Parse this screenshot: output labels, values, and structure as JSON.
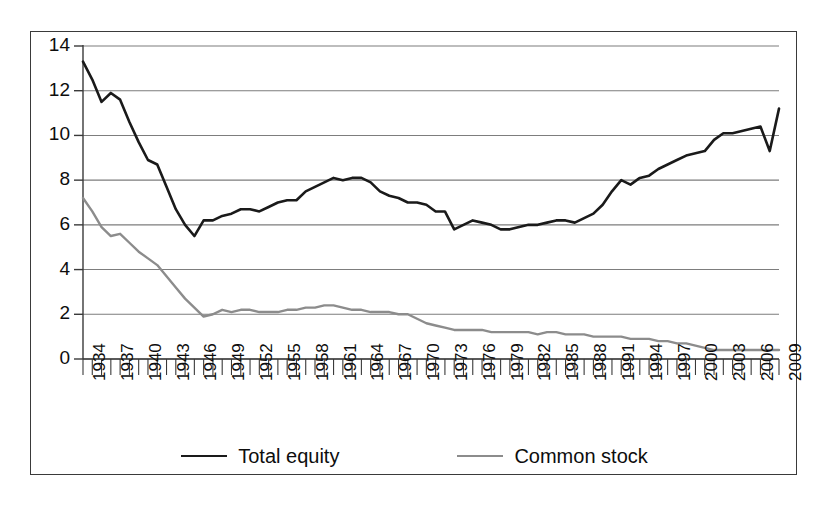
{
  "chart_data": {
    "type": "line",
    "title": "",
    "xlabel": "",
    "ylabel": "",
    "xlim": [
      1934,
      2009
    ],
    "ylim": [
      0,
      14
    ],
    "ytick_step": 2,
    "yticks": [
      0,
      2,
      4,
      6,
      8,
      10,
      12,
      14
    ],
    "xtick_labels": [
      "1934",
      "1937",
      "1940",
      "1943",
      "1946",
      "1949",
      "1952",
      "1955",
      "1958",
      "1961",
      "1964",
      "1967",
      "1970",
      "1973",
      "1976",
      "1979",
      "1982",
      "1985",
      "1988",
      "1991",
      "1994",
      "1997",
      "2000",
      "2003",
      "2006",
      "2009"
    ],
    "xtick_label_interval": 3,
    "minor_tick_interval": 1,
    "grid": "horizontal",
    "legend_position": "bottom",
    "x": [
      1934,
      1935,
      1936,
      1937,
      1938,
      1939,
      1940,
      1941,
      1942,
      1943,
      1944,
      1945,
      1946,
      1947,
      1948,
      1949,
      1950,
      1951,
      1952,
      1953,
      1954,
      1955,
      1956,
      1957,
      1958,
      1959,
      1960,
      1961,
      1962,
      1963,
      1964,
      1965,
      1966,
      1967,
      1968,
      1969,
      1970,
      1971,
      1972,
      1973,
      1974,
      1975,
      1976,
      1977,
      1978,
      1979,
      1980,
      1981,
      1982,
      1983,
      1984,
      1985,
      1986,
      1987,
      1988,
      1989,
      1990,
      1991,
      1992,
      1993,
      1994,
      1995,
      1996,
      1997,
      1998,
      1999,
      2000,
      2001,
      2002,
      2003,
      2004,
      2005,
      2006,
      2007,
      2008,
      2009
    ],
    "series": [
      {
        "name": "Total equity",
        "color": "#1a1a1a",
        "linewidth": 2.6,
        "values": [
          13.3,
          12.5,
          11.5,
          11.9,
          11.6,
          10.6,
          9.7,
          8.9,
          8.7,
          7.7,
          6.7,
          6.0,
          5.5,
          6.2,
          6.2,
          6.4,
          6.5,
          6.7,
          6.7,
          6.6,
          6.8,
          7.0,
          7.1,
          7.1,
          7.5,
          7.7,
          7.9,
          8.1,
          8.0,
          8.1,
          8.1,
          7.9,
          7.5,
          7.3,
          7.2,
          7.0,
          7.0,
          6.9,
          6.6,
          6.6,
          5.8,
          6.0,
          6.2,
          6.1,
          6.0,
          5.8,
          5.8,
          5.9,
          6.0,
          6.0,
          6.1,
          6.2,
          6.2,
          6.1,
          6.3,
          6.5,
          6.9,
          7.5,
          8.0,
          7.8,
          8.1,
          8.2,
          8.5,
          8.7,
          8.9,
          9.1,
          9.2,
          9.3,
          9.8,
          10.1,
          10.1,
          10.2,
          10.3,
          10.4,
          9.3,
          11.2
        ]
      },
      {
        "name": "Common stock",
        "color": "#8c8c8c",
        "linewidth": 2.4,
        "values": [
          7.2,
          6.6,
          5.9,
          5.5,
          5.6,
          5.2,
          4.8,
          4.5,
          4.2,
          3.7,
          3.2,
          2.7,
          2.3,
          1.9,
          2.0,
          2.2,
          2.1,
          2.2,
          2.2,
          2.1,
          2.1,
          2.1,
          2.2,
          2.2,
          2.3,
          2.3,
          2.4,
          2.4,
          2.3,
          2.2,
          2.2,
          2.1,
          2.1,
          2.1,
          2.0,
          2.0,
          1.8,
          1.6,
          1.5,
          1.4,
          1.3,
          1.3,
          1.3,
          1.3,
          1.2,
          1.2,
          1.2,
          1.2,
          1.2,
          1.1,
          1.2,
          1.2,
          1.1,
          1.1,
          1.1,
          1.0,
          1.0,
          1.0,
          1.0,
          0.9,
          0.9,
          0.9,
          0.8,
          0.8,
          0.7,
          0.7,
          0.6,
          0.5,
          0.4,
          0.4,
          0.4,
          0.4,
          0.4,
          0.4,
          0.4,
          0.4
        ]
      }
    ],
    "legend": [
      {
        "label": "Total equity",
        "color": "#1a1a1a"
      },
      {
        "label": "Common stock",
        "color": "#8c8c8c"
      }
    ]
  }
}
